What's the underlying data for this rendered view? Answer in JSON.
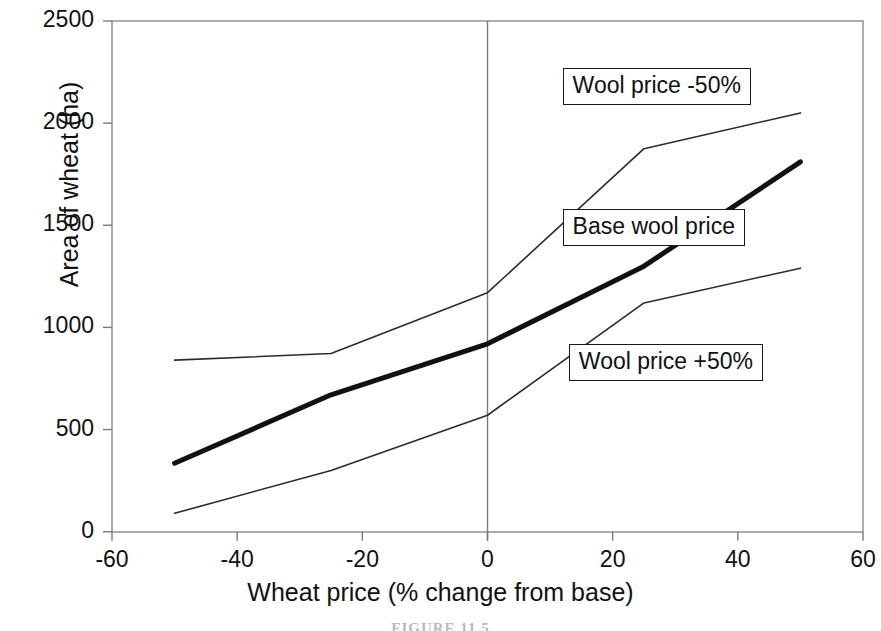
{
  "chart_data": {
    "type": "line",
    "title": "",
    "xlabel": "Wheat price (% change from base)",
    "ylabel": "Area of wheat (ha)",
    "xlim": [
      -60,
      60
    ],
    "ylim": [
      0,
      2500
    ],
    "xticks": [
      -60,
      -40,
      -20,
      0,
      20,
      40,
      60
    ],
    "xtick_labels": [
      "-60",
      "-40",
      "-20",
      "0",
      "20",
      "40",
      "60"
    ],
    "yticks": [
      0,
      500,
      1000,
      1500,
      2000,
      2500
    ],
    "ytick_labels": [
      "0",
      "500",
      "1000",
      "1500",
      "2000",
      "2500"
    ],
    "grid": false,
    "legend_position": "inline-annotations",
    "x": [
      -50,
      -25,
      0,
      25,
      50
    ],
    "series": [
      {
        "name": "Wool price -50%",
        "values": [
          840,
          872,
          1170,
          1875,
          2050
        ],
        "style": "thin",
        "color": "#2b2b2b",
        "width": 1.6
      },
      {
        "name": "Base wool price",
        "values": [
          335,
          670,
          920,
          1300,
          1810
        ],
        "style": "thick",
        "color": "#111111",
        "width": 5
      },
      {
        "name": "Wool price +50%",
        "values": [
          90,
          300,
          570,
          1120,
          1290
        ],
        "style": "thin",
        "color": "#2b2b2b",
        "width": 1.6
      }
    ],
    "annotations": [
      {
        "label": "Wool price -50%",
        "x": 12,
        "y": 2180
      },
      {
        "label": "Base wool price",
        "x": 12,
        "y": 1490
      },
      {
        "label": "Wool price +50%",
        "x": 13,
        "y": 830
      }
    ],
    "axis_line_color": "#7a7a7a",
    "zero_reference_line": 0
  },
  "caption": "FIGURE 11.5",
  "figure": {
    "background": "#ffffff"
  }
}
